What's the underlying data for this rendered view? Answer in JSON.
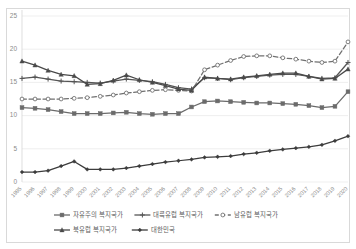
{
  "chart_data": {
    "type": "line",
    "title": "",
    "xlabel": "",
    "ylabel": "",
    "ylim": [
      0,
      25
    ],
    "yticks": [
      0,
      5,
      10,
      15,
      20,
      25
    ],
    "grid": true,
    "legend_position": "bottom",
    "x": [
      "1995",
      "1996",
      "1997",
      "1998",
      "1999",
      "2000",
      "2001",
      "2002",
      "2003",
      "2004",
      "2005",
      "2006",
      "2007",
      "2008",
      "2009",
      "2010",
      "2011",
      "2012",
      "2013",
      "2014",
      "2015",
      "2016",
      "2017",
      "2018",
      "2019",
      "2020"
    ],
    "series": [
      {
        "name": "자유주의 복지국가",
        "marker": "square",
        "line_style": "solid",
        "color": "#6b6b6b",
        "values": [
          11.2,
          11.1,
          10.9,
          10.6,
          10.3,
          10.3,
          10.3,
          10.4,
          10.5,
          10.3,
          10.2,
          10.3,
          10.3,
          11.3,
          12.1,
          12.2,
          12.1,
          12.0,
          11.9,
          11.9,
          11.8,
          11.7,
          11.5,
          11.2,
          11.4,
          13.6
        ]
      },
      {
        "name": "대륙유럽 복지국가",
        "marker": "plus",
        "line_style": "solid",
        "color": "#555555",
        "values": [
          15.6,
          15.8,
          15.5,
          15.2,
          15.1,
          15.0,
          14.9,
          15.2,
          15.5,
          15.3,
          15.1,
          14.7,
          14.2,
          14.0,
          15.7,
          15.6,
          15.4,
          15.7,
          15.9,
          16.1,
          16.2,
          16.2,
          15.9,
          15.6,
          15.7,
          18.0
        ]
      },
      {
        "name": "남유럽 복지국가",
        "marker": "open-circle",
        "line_style": "dashed",
        "color": "#707070",
        "values": [
          12.5,
          12.5,
          12.5,
          12.5,
          12.6,
          12.7,
          12.9,
          13.1,
          13.4,
          13.6,
          13.8,
          13.9,
          13.8,
          13.7,
          16.9,
          17.6,
          18.3,
          18.9,
          19.0,
          19.0,
          18.7,
          18.5,
          18.2,
          18.0,
          18.2,
          21.1
        ]
      },
      {
        "name": "북유럽 복지국가",
        "marker": "triangle",
        "line_style": "solid",
        "color": "#4a4a4a",
        "values": [
          18.2,
          17.6,
          16.8,
          16.2,
          16.0,
          14.7,
          14.8,
          15.3,
          16.1,
          15.4,
          15.0,
          14.5,
          14.0,
          13.8,
          15.8,
          15.6,
          15.5,
          15.8,
          16.0,
          16.2,
          16.4,
          16.4,
          15.9,
          15.5,
          15.6,
          17.0
        ]
      },
      {
        "name": "대한민국",
        "marker": "diamond",
        "line_style": "solid",
        "color": "#3c3c3c",
        "values": [
          1.5,
          1.5,
          1.7,
          2.4,
          3.1,
          1.9,
          1.9,
          1.9,
          2.1,
          2.4,
          2.7,
          3.0,
          3.2,
          3.4,
          3.7,
          3.8,
          3.9,
          4.2,
          4.4,
          4.7,
          4.9,
          5.1,
          5.3,
          5.6,
          6.2,
          6.9
        ]
      }
    ]
  },
  "axes": {
    "y_tick_labels": [
      "0",
      "5",
      "10",
      "15",
      "20",
      "25"
    ],
    "x_tick_labels": [
      "1995",
      "1996",
      "1997",
      "1998",
      "1999",
      "2000",
      "2001",
      "2002",
      "2003",
      "2004",
      "2005",
      "2006",
      "2007",
      "2008",
      "2009",
      "2010",
      "2011",
      "2012",
      "2013",
      "2014",
      "2015",
      "2016",
      "2017",
      "2018",
      "2019",
      "2020"
    ]
  },
  "legend": {
    "row1": [
      {
        "label": "자유주의 복지국가",
        "marker": "square",
        "line_style": "solid"
      },
      {
        "label": "대륙유럽 복지국가",
        "marker": "plus",
        "line_style": "solid"
      },
      {
        "label": "남유럽 복지국가",
        "marker": "open-circle",
        "line_style": "dashed"
      }
    ],
    "row2": [
      {
        "label": "북유럽 복지국가",
        "marker": "triangle",
        "line_style": "solid"
      },
      {
        "label": "대한민국",
        "marker": "diamond",
        "line_style": "solid"
      }
    ]
  },
  "colors": {
    "grid": "#e8e8e8",
    "axis_text": "#8c8c8c",
    "legend_text": "#5e5e5e",
    "frame": "#d9d9d9"
  }
}
